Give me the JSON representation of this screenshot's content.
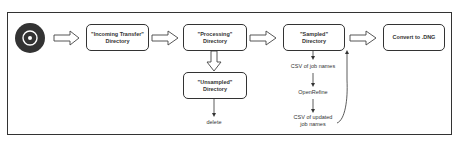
{
  "diagram": {
    "start_icon": "disc-icon",
    "nodes": {
      "incoming": {
        "line1": "\"Incoming Transfer\"",
        "line2": "Directory"
      },
      "processing": {
        "line1": "\"Processing\"",
        "line2": "Directory"
      },
      "sampled": {
        "line1": "\"Sampled\"",
        "line2": "Directory"
      },
      "convert": {
        "line1": "Convert to .DNG"
      },
      "unsampled": {
        "line1": "\"Unsampled\"",
        "line2": "Directory"
      }
    },
    "labels": {
      "delete": "delete",
      "csv_job_names": "CSV of job names",
      "openrefine": "OpenRefine",
      "csv_updated_1": "CSV of updated",
      "csv_updated_2": "job names"
    },
    "colors": {
      "stroke": "#333333",
      "fill": "#ffffff",
      "disc": "#333333"
    }
  }
}
